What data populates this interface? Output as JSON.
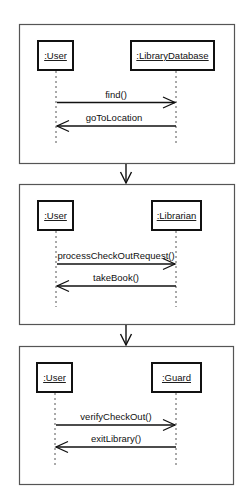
{
  "diagram": {
    "type": "uml-sequence-storyboard",
    "frames": [
      {
        "objects": [
          ":User",
          ":LibraryDatabase"
        ],
        "messages": [
          {
            "label": "find()",
            "from": ":User",
            "to": ":LibraryDatabase",
            "direction": "right"
          },
          {
            "label": "goToLocation",
            "from": ":LibraryDatabase",
            "to": ":User",
            "direction": "left"
          }
        ]
      },
      {
        "objects": [
          ":User",
          ":Librarian"
        ],
        "messages": [
          {
            "label": "processCheckOutRequest()",
            "from": ":User",
            "to": ":Librarian",
            "direction": "right"
          },
          {
            "label": "takeBook()",
            "from": ":Librarian",
            "to": ":User",
            "direction": "left"
          }
        ]
      },
      {
        "objects": [
          ":User",
          ":Guard"
        ],
        "messages": [
          {
            "label": "verifyCheckOut()",
            "from": ":User",
            "to": ":Guard",
            "direction": "right"
          },
          {
            "label": "exitLibrary()",
            "from": ":Guard",
            "to": ":User",
            "direction": "left"
          }
        ]
      }
    ],
    "connectors": [
      "frame-1-to-frame-2",
      "frame-2-to-frame-3"
    ],
    "colors": {
      "stroke": "#111111",
      "frame_border": "#555555",
      "background": "#ffffff"
    }
  }
}
